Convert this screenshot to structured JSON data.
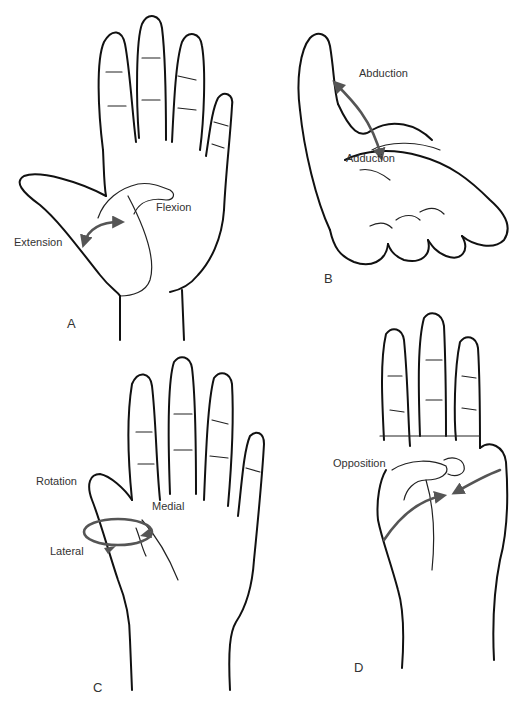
{
  "figure": {
    "panels": [
      {
        "id": "A",
        "letter": "A",
        "labels": {
          "flexion": "Flexion",
          "extension": "Extension"
        }
      },
      {
        "id": "B",
        "letter": "B",
        "labels": {
          "abduction": "Abduction",
          "adduction": "Adduction"
        }
      },
      {
        "id": "C",
        "letter": "C",
        "labels": {
          "rotation": "Rotation",
          "medial": "Medial",
          "lateral": "Lateral"
        }
      },
      {
        "id": "D",
        "letter": "D",
        "labels": {
          "opposition": "Opposition"
        }
      }
    ],
    "colors": {
      "ink": "#111111",
      "arrow": "#555555",
      "text": "#333333",
      "background": "#ffffff"
    }
  }
}
